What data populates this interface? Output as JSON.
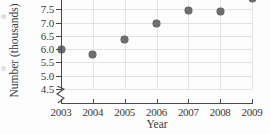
{
  "chart_data": {
    "type": "scatter",
    "title": "",
    "xlabel": "Year",
    "ylabel": "Number (thousands)",
    "categories": [
      "2003",
      "2004",
      "2005",
      "2006",
      "2007",
      "2008",
      "2009"
    ],
    "x": [
      2003,
      2004,
      2005,
      2006,
      2007,
      2008,
      2009
    ],
    "values": [
      6.0,
      5.8,
      6.35,
      6.95,
      7.45,
      7.42,
      7.9
    ],
    "series": [
      {
        "name": "Number (thousands)",
        "values": [
          6.0,
          5.8,
          6.35,
          6.95,
          7.45,
          7.42,
          7.9
        ]
      }
    ],
    "xlim": [
      2003,
      2009
    ],
    "ylim": [
      4.5,
      8.0
    ],
    "ytick_labels": [
      "4.5",
      "5.0",
      "5.5",
      "6.0",
      "6.5",
      "7.0",
      "7.5",
      "8.0"
    ],
    "ytick_values": [
      4.5,
      5.0,
      5.5,
      6.0,
      6.5,
      7.0,
      7.5,
      8.0
    ],
    "xtick_labels": [
      "2003",
      "2004",
      "2005",
      "2006",
      "2007",
      "2008",
      "2009"
    ],
    "grid": true,
    "legend": false,
    "axis_break": true,
    "marker_color": "#6e6e72",
    "grid_color": "#e2e2e2",
    "axis_color": "#4a4a4a"
  }
}
